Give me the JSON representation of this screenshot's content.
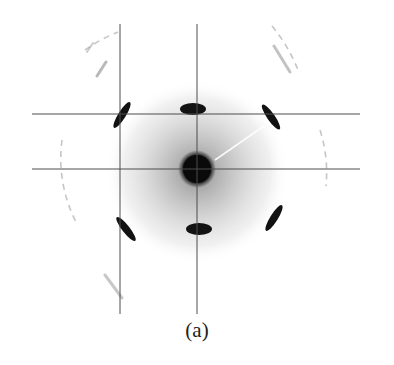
{
  "figure": {
    "caption": "(a)",
    "colors": {
      "spot": "#111111",
      "halo": "#9a9a9a",
      "line": "#555555",
      "background": "#ffffff"
    },
    "guide_lines": {
      "vertical_x": [
        120,
        197
      ],
      "vertical_y_range": [
        24,
        314
      ],
      "horizontal_y": [
        114,
        169
      ],
      "horizontal_x_range": [
        32,
        360
      ]
    },
    "center": {
      "x": 197,
      "y": 169
    }
  }
}
